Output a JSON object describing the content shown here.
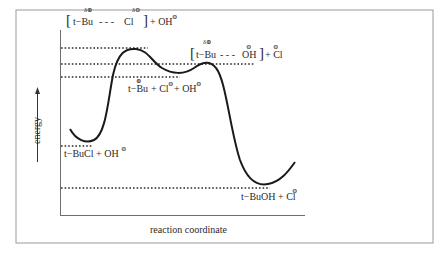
{
  "figure": {
    "type": "energy-profile",
    "x_axis_label": "reaction coordinate",
    "y_axis_label": "energy",
    "colors": {
      "curve": "#1a1a1a",
      "axis": "#6e6e6e",
      "frame": "#9a9a9a",
      "dots": "#2a2a2a"
    }
  },
  "labels": {
    "ts1": {
      "bracket_open": "[",
      "part1": "t−Bu",
      "bond": "- - -",
      "part2": "Cl",
      "bracket_close": "]",
      "delta1": "δ⊕",
      "delta2": "δ⊖",
      "plus": "+ OH",
      "charge": "⊖"
    },
    "ts2": {
      "bracket_open": "[",
      "part1": "t−Bu",
      "bond": "- - -",
      "part2": "OH",
      "bracket_close": "]",
      "delta1": "δ⊕",
      "charge_oh": "⊖",
      "plus": "+ Cl",
      "charge_cl": "⊖"
    },
    "intermediate": {
      "text1": "t−Bu",
      "charge1": "⊕",
      "text2": "+ Cl",
      "charge2": "⊖",
      "text3": "+ OH",
      "charge3": "⊖"
    },
    "reactants": {
      "text": "t−BuCl + OH",
      "charge": "⊖"
    },
    "products": {
      "text": "t−BuOH + Cl",
      "charge": "⊖"
    }
  },
  "levels": [
    {
      "name": "transition-state-1",
      "y": 48
    },
    {
      "name": "transition-state-2",
      "y": 64
    },
    {
      "name": "carbocation-intermediate",
      "y": 77
    },
    {
      "name": "reactants",
      "y": 146
    },
    {
      "name": "products",
      "y": 188
    }
  ]
}
